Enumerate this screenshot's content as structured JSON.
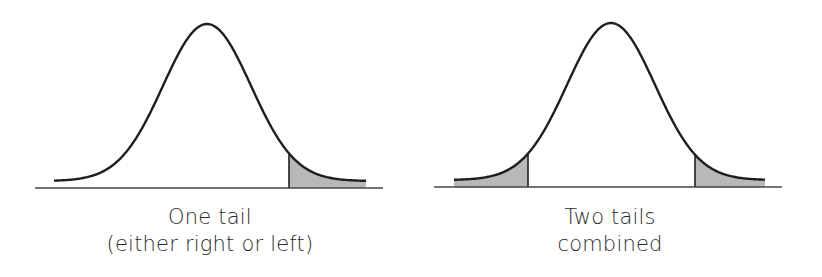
{
  "colors": {
    "stroke": "#1e1e1e",
    "baseline": "#444444",
    "shade": "#b8b8b8",
    "text": "#2a2a2a",
    "background": "#ffffff"
  },
  "panels": [
    {
      "id": "one-tail",
      "caption_line1": "One tail",
      "caption_line2": "(either right or left)",
      "baseline": {
        "x1": 35,
        "x2": 383,
        "y": 188
      },
      "curve": {
        "x_start": 54,
        "x_end": 366,
        "peak_x": 207,
        "peak_y": 24,
        "sigma": 44,
        "floor_y": 181
      },
      "shaded_regions": [
        {
          "from_x": 289,
          "to_x": 366
        }
      ]
    },
    {
      "id": "two-tails",
      "caption_line1": "Two tails",
      "caption_line2": "combined",
      "baseline": {
        "x1": 434,
        "x2": 782,
        "y": 187
      },
      "curve": {
        "x_start": 454,
        "x_end": 765,
        "peak_x": 611,
        "peak_y": 23,
        "sigma": 44,
        "floor_y": 180
      },
      "shaded_regions": [
        {
          "from_x": 454,
          "to_x": 528
        },
        {
          "from_x": 695,
          "to_x": 765
        }
      ]
    }
  ]
}
